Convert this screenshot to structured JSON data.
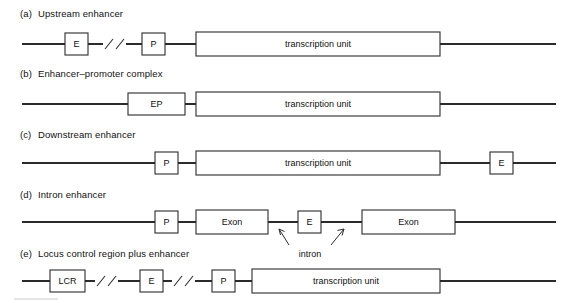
{
  "figure": {
    "caption_prefix_a": "(a)",
    "caption_prefix_b": "(b)",
    "caption_prefix_c": "(c)",
    "caption_prefix_d": "(d)",
    "caption_prefix_e": "(e)"
  },
  "panels": [
    {
      "id": "a",
      "marker": "(a)",
      "title": "Upstream enhancer",
      "elements": [
        {
          "name": "enhancer-box",
          "label": "E"
        },
        {
          "name": "break-symbol",
          "label": ""
        },
        {
          "name": "promoter-box",
          "label": "P"
        },
        {
          "name": "transcription-unit-box",
          "label": "transcription unit"
        }
      ]
    },
    {
      "id": "b",
      "marker": "(b)",
      "title": "Enhancer–promoter complex",
      "elements": [
        {
          "name": "enhancer-promoter-box",
          "label": "EP"
        },
        {
          "name": "transcription-unit-box",
          "label": "transcription unit"
        }
      ]
    },
    {
      "id": "c",
      "marker": "(c)",
      "title": "Downstream enhancer",
      "elements": [
        {
          "name": "promoter-box",
          "label": "P"
        },
        {
          "name": "transcription-unit-box",
          "label": "transcription unit"
        },
        {
          "name": "enhancer-box",
          "label": "E"
        }
      ]
    },
    {
      "id": "d",
      "marker": "(d)",
      "title": "Intron enhancer",
      "elements": [
        {
          "name": "promoter-box",
          "label": "P"
        },
        {
          "name": "exon-box-1",
          "label": "Exon"
        },
        {
          "name": "enhancer-box",
          "label": "E"
        },
        {
          "name": "exon-box-2",
          "label": "Exon"
        }
      ],
      "annotation": "intron"
    },
    {
      "id": "e",
      "marker": "(e)",
      "title": "Locus control region plus enhancer",
      "elements": [
        {
          "name": "lcr-box",
          "label": "LCR"
        },
        {
          "name": "break-symbol-1",
          "label": ""
        },
        {
          "name": "enhancer-box",
          "label": "E"
        },
        {
          "name": "break-symbol-2",
          "label": ""
        },
        {
          "name": "promoter-box",
          "label": "P"
        },
        {
          "name": "transcription-unit-box",
          "label": "transcription unit"
        }
      ]
    }
  ],
  "colors": {
    "line": "#2b2b2b",
    "text": "#111111",
    "background": "#ffffff"
  }
}
